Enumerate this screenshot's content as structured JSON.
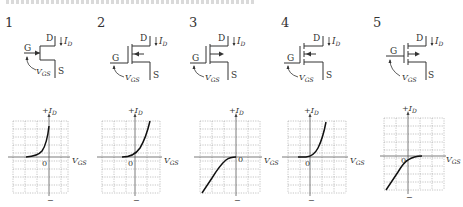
{
  "header": {
    "clipped_text": ""
  },
  "options": [
    {
      "number": "1",
      "symbol": {
        "type": "jfet",
        "channel": "continuous",
        "arrow": "in",
        "gate_offset": "center",
        "labels": {
          "drain": "D",
          "gate": "G",
          "source": "S",
          "current": "I_D",
          "voltage": "V_GS"
        }
      },
      "graph": {
        "y_label": "+I_D",
        "x_label": "V_GS",
        "origin": "0",
        "minus": "−"
      }
    },
    {
      "number": "2",
      "symbol": {
        "type": "mosfet",
        "channel": "continuous",
        "arrow": "in",
        "gate_offset": "bottom",
        "labels": {
          "drain": "D",
          "gate": "G",
          "source": "S",
          "current": "I_D",
          "voltage": "V_GS"
        }
      },
      "graph": {
        "y_label": "+I_D",
        "x_label": "V_GS",
        "origin": "0",
        "minus": "−"
      }
    },
    {
      "number": "3",
      "symbol": {
        "type": "mosfet",
        "channel": "continuous",
        "arrow": "out",
        "gate_offset": "bottom",
        "labels": {
          "drain": "D",
          "gate": "G",
          "source": "S",
          "current": "I_D",
          "voltage": "V_GS"
        }
      },
      "graph": {
        "y_label": "+I_D",
        "x_label": "V_GS",
        "origin": "0",
        "minus": "−"
      }
    },
    {
      "number": "4",
      "symbol": {
        "type": "mosfet",
        "channel": "segmented",
        "arrow": "in",
        "gate_offset": "bottom",
        "labels": {
          "drain": "D",
          "gate": "G",
          "source": "S",
          "current": "I_D",
          "voltage": "V_GS"
        }
      },
      "graph": {
        "y_label": "+I_D",
        "x_label": "V_GS",
        "origin": "0",
        "minus": "−"
      }
    },
    {
      "number": "5",
      "symbol": {
        "type": "mosfet",
        "channel": "segmented",
        "arrow": "out",
        "gate_offset": "top",
        "labels": {
          "drain": "D",
          "gate": "G",
          "source": "S",
          "current": "I_D",
          "voltage": "V_GS"
        }
      },
      "graph": {
        "y_label": "+I_D",
        "x_label": "V_GS",
        "origin": "0",
        "minus": "−"
      }
    }
  ],
  "chart_data": [
    {
      "type": "line",
      "title": "1",
      "xlabel": "V_GS",
      "ylabel": "+I_D",
      "grid": true,
      "x": [
        -2,
        -1.5,
        -1,
        -0.5,
        0
      ],
      "y": [
        0,
        0.15,
        0.45,
        1.3,
        2.7
      ],
      "xlim": [
        -3,
        1
      ],
      "ylim": [
        -3,
        2.7
      ]
    },
    {
      "type": "line",
      "title": "2",
      "xlabel": "V_GS",
      "ylabel": "+I_D",
      "grid": true,
      "x": [
        -1,
        -0.5,
        0,
        0.5,
        1,
        1.5
      ],
      "y": [
        0,
        0.1,
        0.4,
        1.0,
        1.9,
        3.0
      ],
      "xlim": [
        -3,
        2
      ],
      "ylim": [
        -3,
        3
      ]
    },
    {
      "type": "line",
      "title": "3",
      "xlabel": "V_GS",
      "ylabel": "+I_D",
      "grid": true,
      "x": [
        -3,
        -2.4,
        -1.7,
        -1.2,
        -0.6,
        0
      ],
      "y": [
        -4,
        -3,
        -1.6,
        -0.6,
        -0.1,
        0
      ],
      "xlim": [
        -3,
        2
      ],
      "ylim": [
        -4,
        4
      ]
    },
    {
      "type": "line",
      "title": "4",
      "xlabel": "V_GS",
      "ylabel": "+I_D",
      "grid": true,
      "x": [
        -1,
        -0.5,
        0,
        0.5,
        1,
        1.3
      ],
      "y": [
        0,
        0,
        0.3,
        1.1,
        2.3,
        3.2
      ],
      "xlim": [
        -1,
        3
      ],
      "ylim": [
        -3,
        3.2
      ]
    },
    {
      "type": "line",
      "title": "5",
      "xlabel": "V_GS",
      "ylabel": "+I_D",
      "grid": true,
      "x": [
        -2,
        -1.3,
        -0.6,
        0,
        0.5,
        1.2
      ],
      "y": [
        -3,
        -2,
        -0.9,
        -0.3,
        0,
        0
      ],
      "xlim": [
        -2,
        3
      ],
      "ylim": [
        -3,
        4
      ]
    }
  ]
}
